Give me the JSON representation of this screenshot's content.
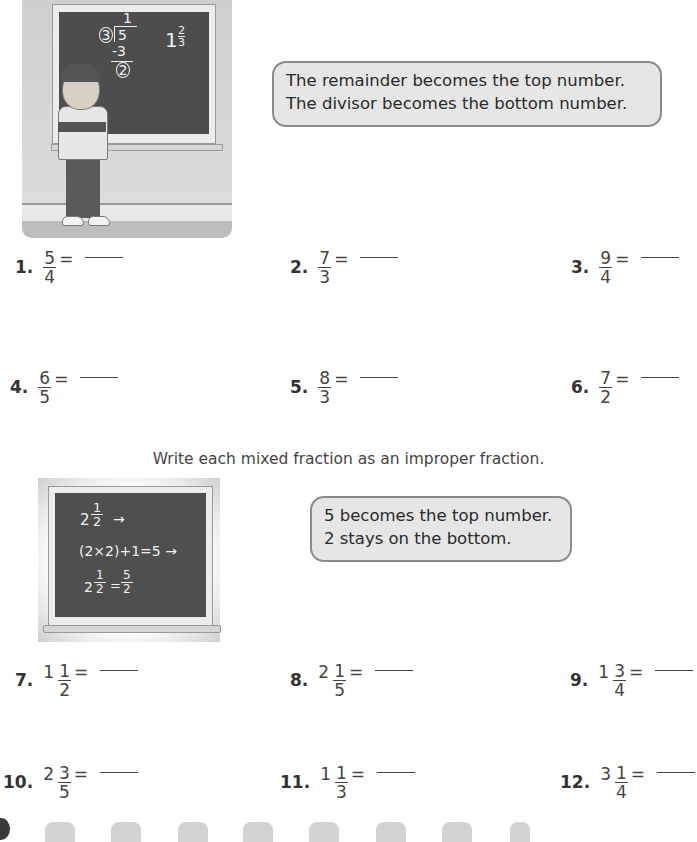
{
  "scene1": {
    "board": {
      "quotient": "1",
      "divisor": "3",
      "dividend": "5",
      "subtract": "-3",
      "remainder": "2",
      "answer_whole": "1",
      "answer_num": "2",
      "answer_den": "3"
    },
    "bubble_lines": [
      "The remainder becomes the top number.",
      "The divisor becomes the bottom number."
    ]
  },
  "section1": {
    "problems": [
      {
        "number": "1.",
        "num": "5",
        "den": "4",
        "equals": "="
      },
      {
        "number": "2.",
        "num": "7",
        "den": "3",
        "equals": "="
      },
      {
        "number": "3.",
        "num": "9",
        "den": "4",
        "equals": "="
      },
      {
        "number": "4.",
        "num": "6",
        "den": "5",
        "equals": "="
      },
      {
        "number": "5.",
        "num": "8",
        "den": "3",
        "equals": "="
      },
      {
        "number": "6.",
        "num": "7",
        "den": "2",
        "equals": "="
      }
    ]
  },
  "section2": {
    "instruction": "Write each mixed fraction as an improper fraction.",
    "board": {
      "line1_whole": "2",
      "line1_num": "1",
      "line1_den": "2",
      "line1_arrow": "→",
      "line2": "(2×2)+1=5 →",
      "line3_whole": "2",
      "line3_num": "1",
      "line3_den": "2",
      "line3_eq": "=",
      "line3_rnum": "5",
      "line3_rden": "2"
    },
    "bubble_lines": [
      "5 becomes the top number.",
      "2 stays on the bottom."
    ],
    "problems": [
      {
        "number": "7.",
        "whole": "1",
        "num": "1",
        "den": "2",
        "equals": "="
      },
      {
        "number": "8.",
        "whole": "2",
        "num": "1",
        "den": "5",
        "equals": "="
      },
      {
        "number": "9.",
        "whole": "1",
        "num": "3",
        "den": "4",
        "equals": "="
      },
      {
        "number": "10.",
        "whole": "2",
        "num": "3",
        "den": "5",
        "equals": "="
      },
      {
        "number": "11.",
        "whole": "1",
        "num": "1",
        "den": "3",
        "equals": "="
      },
      {
        "number": "12.",
        "whole": "3",
        "num": "1",
        "den": "4",
        "equals": "="
      }
    ]
  },
  "footer": {
    "tab_count": 8
  }
}
